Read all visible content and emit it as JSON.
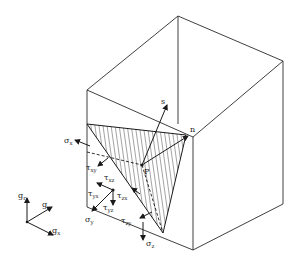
{
  "diagram": {
    "type": "stress-tetrahedron",
    "labels": {
      "normal": "n",
      "traction": "s",
      "point": "P",
      "sigma_x": {
        "base": "σ",
        "sub": "x"
      },
      "sigma_y": {
        "base": "σ",
        "sub": "y"
      },
      "sigma_z": {
        "base": "σ",
        "sub": "z"
      },
      "tau_xy": {
        "base": "τ",
        "sub": "xy"
      },
      "tau_xz": {
        "base": "τ",
        "sub": "xz"
      },
      "tau_yx": {
        "base": "τ",
        "sub": "yx"
      },
      "tau_yz": {
        "base": "τ",
        "sub": "yz"
      },
      "tau_zx": {
        "base": "τ",
        "sub": "zx"
      },
      "tau_zy": {
        "base": "τ",
        "sub": "zy"
      },
      "axis_x": {
        "base": "g",
        "sub": "x"
      },
      "axis_y": {
        "base": "g",
        "sub": "y"
      },
      "axis_z": {
        "base": "g",
        "sub": "r"
      }
    },
    "colors": {
      "line": "#1a1a1a",
      "background": "#ffffff"
    }
  }
}
